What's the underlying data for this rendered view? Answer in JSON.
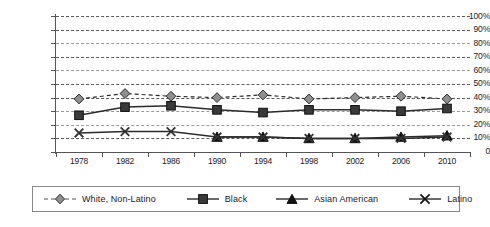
{
  "chart_data": {
    "type": "line",
    "title": "",
    "subtitle": "",
    "xlabel": "",
    "ylabel": "",
    "categories": [
      "1978",
      "1982",
      "1986",
      "1990",
      "1994",
      "1998",
      "2002",
      "2006",
      "2010"
    ],
    "x_tick_labels": [
      "1978",
      "1982",
      "1986",
      "1990",
      "1994",
      "1998",
      "2002",
      "2006",
      "2010"
    ],
    "y_tick_labels": [
      "100%",
      "90%",
      "80%",
      "70%",
      "60%",
      "50%",
      "40%",
      "30%",
      "20%",
      "10%",
      "0"
    ],
    "y_tick_values": [
      100,
      90,
      80,
      70,
      60,
      50,
      40,
      30,
      20,
      10,
      0
    ],
    "ylim": [
      0,
      100
    ],
    "grid": "horizontal-dashed",
    "legend_position": "bottom",
    "series": [
      {
        "name": "White, Non-Latino",
        "marker": "diamond",
        "line_style": "dashed",
        "color": "#8f8f8f",
        "values": [
          39,
          43,
          41,
          40,
          42,
          39,
          40,
          41,
          39
        ]
      },
      {
        "name": "Black",
        "marker": "square",
        "line_style": "solid",
        "color": "#3a3a3a",
        "values": [
          27,
          33,
          34,
          31,
          29,
          31,
          31,
          30,
          32
        ]
      },
      {
        "name": "Asian American",
        "marker": "triangle",
        "line_style": "solid",
        "color": "#111111",
        "values": [
          null,
          null,
          null,
          11,
          11,
          10,
          10,
          11,
          12
        ]
      },
      {
        "name": "Latino",
        "marker": "x",
        "line_style": "solid",
        "color": "#333333",
        "values": [
          14,
          15,
          15,
          11,
          11,
          10,
          10,
          10,
          11
        ]
      }
    ]
  },
  "legend": {
    "items": [
      {
        "label": "White, Non-Latino",
        "marker": "diamond-marker-icon"
      },
      {
        "label": "Black",
        "marker": "square-marker-icon"
      },
      {
        "label": "Asian American",
        "marker": "triangle-marker-icon"
      },
      {
        "label": "Latino",
        "marker": "x-marker-icon"
      }
    ]
  },
  "colors": {
    "white_non_latino": "#8f8f8f",
    "black": "#3a3a3a",
    "asian_american": "#111111",
    "latino": "#333333",
    "axis": "#555555",
    "grid": "#5a5a5a",
    "background": "#ffffff"
  }
}
